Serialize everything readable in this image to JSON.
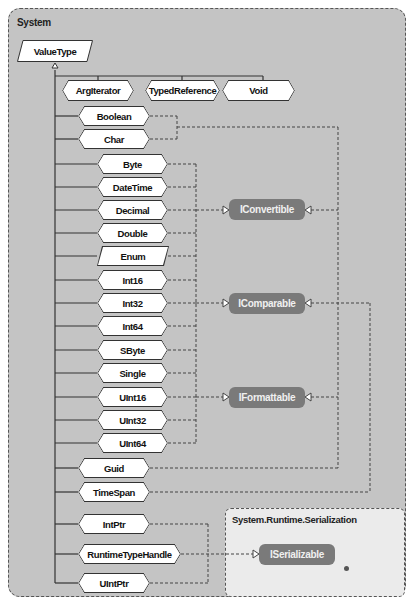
{
  "namespaces": {
    "system": {
      "label": "System"
    },
    "serialization": {
      "label": "System.Runtime.Serialization"
    }
  },
  "base_type": {
    "label": "ValueType"
  },
  "top_row": [
    {
      "label": "ArgIterator"
    },
    {
      "label": "TypedReference"
    },
    {
      "label": "Void"
    }
  ],
  "types": {
    "boolean": "Boolean",
    "char": "Char",
    "byte": "Byte",
    "datetime": "DateTime",
    "decimal": "Decimal",
    "double": "Double",
    "enum": "Enum",
    "int16": "Int16",
    "int32": "Int32",
    "int64": "Int64",
    "sbyte": "SByte",
    "single": "Single",
    "uint16": "UInt16",
    "uint32": "UInt32",
    "uint64": "UInt64",
    "guid": "Guid",
    "timespan": "TimeSpan",
    "intptr": "IntPtr",
    "runtimetypehandle": "RuntimeTypeHandle",
    "uintptr": "UIntPtr"
  },
  "interfaces": {
    "iconvertible": "IConvertible",
    "icomparable": "IComparable",
    "iformattable": "IFormattable",
    "iserializable": "ISerializable"
  },
  "colors": {
    "outer_bg": "#bdbdbd",
    "inner_bg": "#e6e6e6",
    "node_bg": "#ffffff",
    "interface_bg": "#7a7a7a",
    "line": "#444444"
  }
}
